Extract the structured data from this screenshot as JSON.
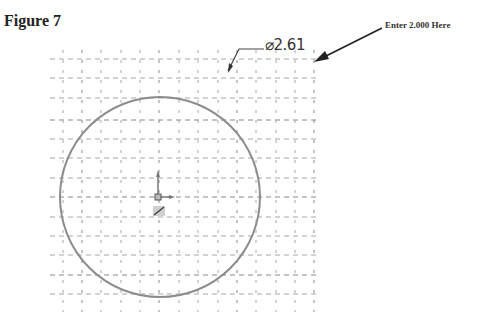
{
  "figure": {
    "title": "Figure 7"
  },
  "callout": {
    "text": "Enter 2.000 Here"
  },
  "dimension": {
    "symbol": "⌀",
    "value": "2.61",
    "label": "⌀2.61"
  },
  "sketch": {
    "circle": {
      "cx": 160,
      "cy": 197,
      "r": 100,
      "color": "#8a8a8a"
    },
    "grid": {
      "color": "#9a9a9a",
      "x_start": 50,
      "x_end": 320,
      "y_start": 50,
      "y_end": 312,
      "spacing": 19.5
    }
  }
}
